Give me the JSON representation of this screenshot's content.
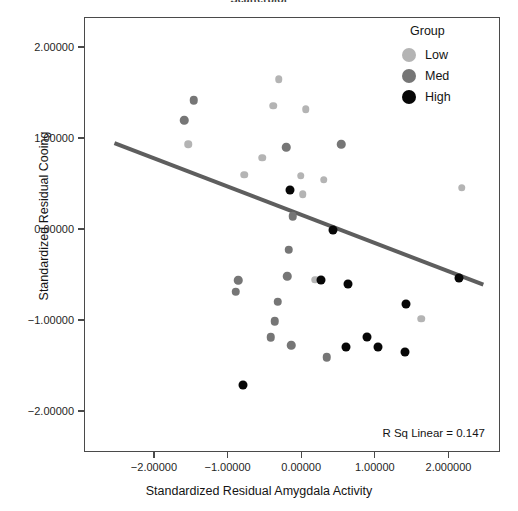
{
  "chart_data": {
    "type": "scatter",
    "title": "Scatterplot",
    "xlabel": "Standardized Residual Amygdala Activity",
    "ylabel": "Standardized Residual Cooing",
    "xlim": [
      -2.95,
      2.7
    ],
    "ylim": [
      -2.45,
      2.33
    ],
    "xticks": [
      -2,
      -1,
      0,
      1,
      2
    ],
    "xtick_labels": [
      "−2.00000",
      "−1.00000",
      "0.00000",
      "1.00000",
      "2.000000"
    ],
    "yticks": [
      2,
      1,
      0,
      -1,
      -2
    ],
    "ytick_labels": [
      "2.00000",
      "1.00000",
      "0.00000",
      "−1.00000",
      "−2.00000"
    ],
    "grid": false,
    "legend": {
      "title": "Group",
      "position": "top-right",
      "entries": [
        {
          "label": "Low",
          "color": "#b4b4b4"
        },
        {
          "label": "Med",
          "color": "#767676"
        },
        {
          "label": "High",
          "color": "#070707"
        }
      ]
    },
    "annotation": "R Sq Linear = 0.147",
    "r_squared": 0.147,
    "fit_line": {
      "type": "linear",
      "color": "#5e5e5e",
      "width": 4,
      "x_start": -2.55,
      "y_start": 0.955,
      "x_end": 2.46,
      "y_end": -0.6
    },
    "series": [
      {
        "name": "Low",
        "color": "#b4b4b4",
        "points": [
          [
            -0.32,
            1.655
          ],
          [
            -0.39,
            1.365
          ],
          [
            0.05,
            1.325
          ],
          [
            -1.55,
            0.945
          ],
          [
            -0.54,
            0.795
          ],
          [
            -0.79,
            0.605
          ],
          [
            -0.02,
            0.595
          ],
          [
            0.29,
            0.555
          ],
          [
            0.01,
            0.395
          ],
          [
            2.17,
            0.465
          ],
          [
            0.18,
            -0.545
          ],
          [
            1.62,
            -0.975
          ]
        ]
      },
      {
        "name": "Med",
        "color": "#767676",
        "points": [
          [
            -1.47,
            1.425
          ],
          [
            -1.6,
            1.205
          ],
          [
            -0.22,
            0.91
          ],
          [
            0.53,
            0.94
          ],
          [
            -0.13,
            0.15
          ],
          [
            -0.87,
            -0.55
          ],
          [
            -0.9,
            -0.68
          ],
          [
            -0.18,
            -0.215
          ],
          [
            -0.2,
            -0.51
          ],
          [
            -0.33,
            -0.79
          ],
          [
            -0.37,
            -1.005
          ],
          [
            -0.43,
            -1.18
          ],
          [
            -0.15,
            -1.265
          ],
          [
            0.33,
            -1.4
          ]
        ]
      },
      {
        "name": "High",
        "color": "#070707",
        "points": [
          [
            -0.17,
            0.44
          ],
          [
            0.42,
            0.005
          ],
          [
            0.26,
            -0.545
          ],
          [
            0.62,
            -0.59
          ],
          [
            2.13,
            -0.525
          ],
          [
            1.41,
            -0.81
          ],
          [
            0.88,
            -1.175
          ],
          [
            0.6,
            -1.29
          ],
          [
            1.03,
            -1.29
          ],
          [
            1.4,
            -1.335
          ],
          [
            -0.81,
            -1.705
          ]
        ]
      }
    ]
  }
}
